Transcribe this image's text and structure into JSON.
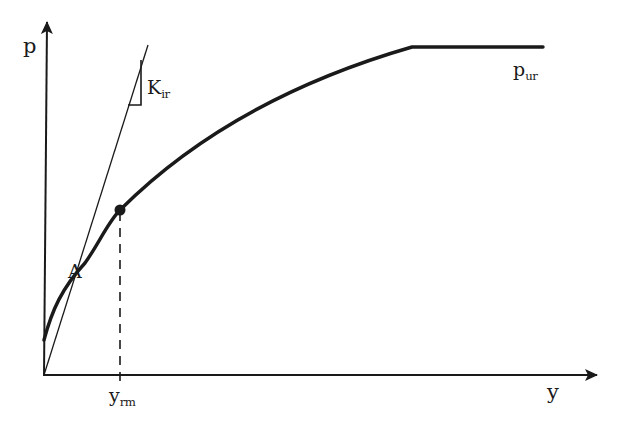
{
  "figure": {
    "type": "p-y curve (lateral load vs. deflection)",
    "colors": {
      "ink": "#1a1a1a",
      "background": "#ffffff"
    }
  },
  "axes": {
    "y_axis_label": "p",
    "x_axis_label": "y"
  },
  "labels": {
    "initial_stiffness": {
      "main": "K",
      "sub": "ir"
    },
    "ultimate_resistance": {
      "main": "p",
      "sub": "ur"
    },
    "point_a": "A",
    "y_rm": {
      "main": "y",
      "sub": "rm"
    }
  },
  "geometry": {
    "origin": [
      44,
      375
    ],
    "y_axis_top": [
      47,
      22
    ],
    "x_axis_end": [
      597,
      375
    ],
    "curve_start": [
      44,
      340
    ],
    "point_a": [
      85,
      263
    ],
    "marked_point": [
      120,
      210
    ],
    "plateau_start": [
      412,
      47
    ],
    "plateau_end": [
      543,
      47
    ],
    "tangent_end": [
      148,
      45
    ],
    "dashed_drop": {
      "x": 120,
      "from_y": 210,
      "to_y": 385
    }
  }
}
